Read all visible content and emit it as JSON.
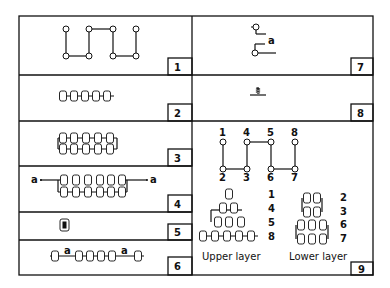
{
  "figure": {
    "panels": [
      {
        "id": 1,
        "number_label": "1",
        "content": "four-node-linear-chain-circle-diagram"
      },
      {
        "id": 2,
        "number_label": "2",
        "content": "single-row-five-ring-chain"
      },
      {
        "id": 3,
        "number_label": "3",
        "content": "two-row-five-ring-ladder"
      },
      {
        "id": 4,
        "number_label": "4",
        "content": "two-row-six-ring-ladder-with-a-ends",
        "end_labels": [
          "a",
          "a"
        ]
      },
      {
        "id": 5,
        "number_label": "5",
        "content": "single-ring-filled"
      },
      {
        "id": 6,
        "number_label": "6",
        "content": "ring-chain-with-a-spacers",
        "inline_labels": [
          "a",
          "a"
        ]
      },
      {
        "id": 7,
        "number_label": "7",
        "content": "two-terminal-offset-connector",
        "label": "a"
      },
      {
        "id": 8,
        "number_label": "8",
        "content": "ground-terminal-symbol"
      },
      {
        "id": 9,
        "number_label": "9",
        "content": "eight-node-layered-arrangement",
        "top_labels": [
          "1",
          "4",
          "5",
          "8"
        ],
        "bottom_labels": [
          "2",
          "3",
          "6",
          "7"
        ],
        "upper_layer": {
          "caption": "Upper layer",
          "row_labels": [
            "1",
            "4",
            "5",
            "8"
          ]
        },
        "lower_layer": {
          "caption": "Lower layer",
          "row_labels": [
            "2",
            "3",
            "6",
            "7"
          ]
        }
      }
    ],
    "colors": {
      "line": "#111111",
      "background": "#ffffff"
    }
  }
}
